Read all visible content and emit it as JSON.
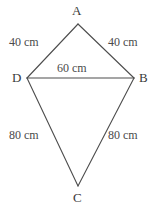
{
  "figure": {
    "type": "geometry-diagram",
    "shape_name": "kite",
    "stroke_color": "#4d4d4d",
    "label_color": "#3f3f3f",
    "background_color": "#ffffff",
    "vertices": [
      {
        "id": "A",
        "label": "A",
        "x": 78,
        "y": 24
      },
      {
        "id": "B",
        "label": "B",
        "x": 134,
        "y": 78
      },
      {
        "id": "C",
        "label": "C",
        "x": 78,
        "y": 186
      },
      {
        "id": "D",
        "label": "D",
        "x": 27,
        "y": 78
      }
    ],
    "edges": [
      {
        "id": "AD",
        "from": "A",
        "to": "D",
        "length_label": "40 cm"
      },
      {
        "id": "AB",
        "from": "A",
        "to": "B",
        "length_label": "40 cm"
      },
      {
        "id": "DB",
        "from": "D",
        "to": "B",
        "length_label": "60 cm"
      },
      {
        "id": "DC",
        "from": "D",
        "to": "C",
        "length_label": "80 cm"
      },
      {
        "id": "BC",
        "from": "B",
        "to": "C",
        "length_label": "80 cm"
      }
    ],
    "labels": {
      "vertex_a": "A",
      "vertex_b": "B",
      "vertex_c": "C",
      "vertex_d": "D",
      "side_ad": "40 cm",
      "side_ab": "40 cm",
      "diagonal_db": "60 cm",
      "side_dc": "80 cm",
      "side_bc": "80 cm"
    }
  }
}
